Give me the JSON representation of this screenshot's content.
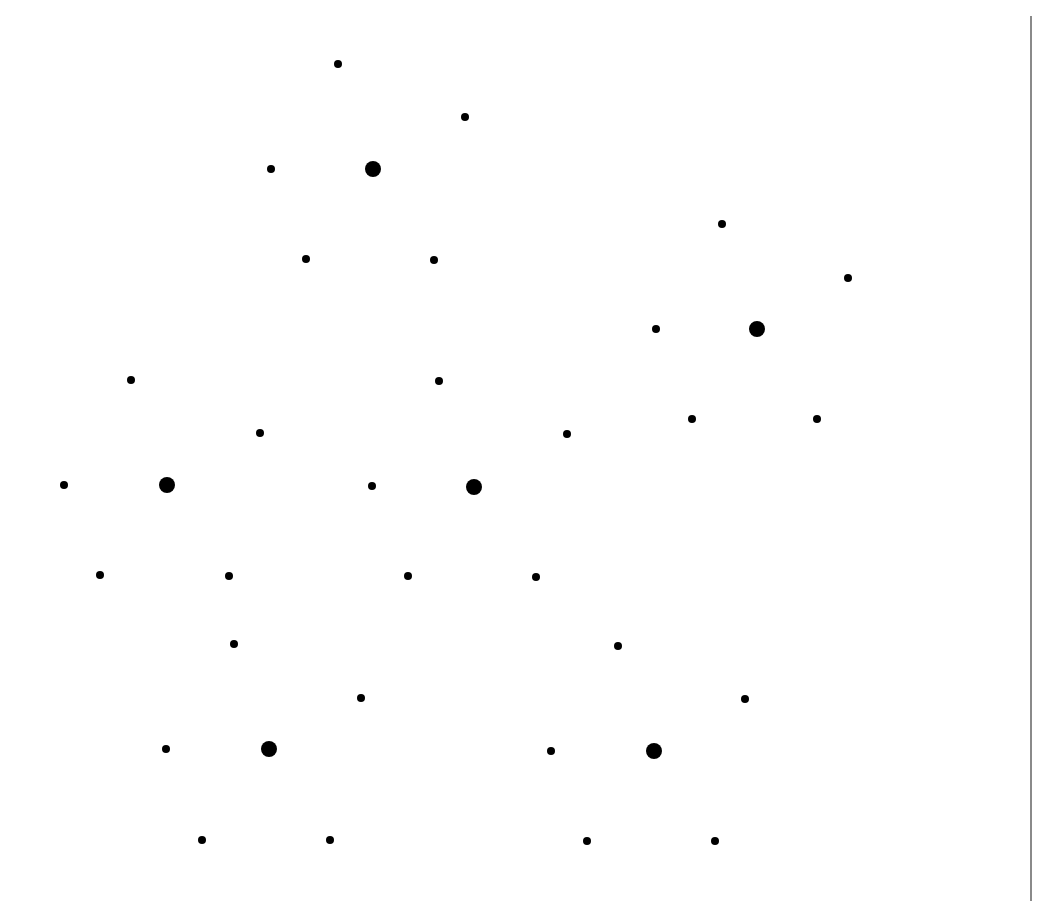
{
  "diagram": {
    "type": "dot-pattern",
    "colors": {
      "background": "#ffffff",
      "dot": "#000000",
      "rule": "#8a8a8a"
    },
    "dot_sizes": {
      "small": 8,
      "large": 16
    },
    "right_rule": {
      "x": 1030,
      "y_start": 16,
      "y_end": 901,
      "width": 2
    },
    "clusters": [
      {
        "id": "top-center",
        "center": {
          "x": 373,
          "y": 169
        },
        "satellites": [
          {
            "x": 338,
            "y": 64
          },
          {
            "x": 465,
            "y": 117
          },
          {
            "x": 271,
            "y": 169
          },
          {
            "x": 306,
            "y": 259
          },
          {
            "x": 434,
            "y": 260
          }
        ]
      },
      {
        "id": "upper-right",
        "center": {
          "x": 757,
          "y": 329
        },
        "satellites": [
          {
            "x": 722,
            "y": 224
          },
          {
            "x": 848,
            "y": 278
          },
          {
            "x": 656,
            "y": 329
          },
          {
            "x": 692,
            "y": 419
          },
          {
            "x": 817,
            "y": 419
          }
        ]
      },
      {
        "id": "middle-left",
        "center": {
          "x": 167,
          "y": 485
        },
        "satellites": [
          {
            "x": 131,
            "y": 380
          },
          {
            "x": 260,
            "y": 433
          },
          {
            "x": 64,
            "y": 485
          },
          {
            "x": 100,
            "y": 575
          },
          {
            "x": 229,
            "y": 576
          }
        ]
      },
      {
        "id": "middle-center",
        "center": {
          "x": 474,
          "y": 487
        },
        "satellites": [
          {
            "x": 439,
            "y": 381
          },
          {
            "x": 567,
            "y": 434
          },
          {
            "x": 372,
            "y": 486
          },
          {
            "x": 408,
            "y": 576
          },
          {
            "x": 536,
            "y": 577
          }
        ]
      },
      {
        "id": "lower-left",
        "center": {
          "x": 269,
          "y": 749
        },
        "satellites": [
          {
            "x": 234,
            "y": 644
          },
          {
            "x": 361,
            "y": 698
          },
          {
            "x": 166,
            "y": 749
          },
          {
            "x": 202,
            "y": 840
          },
          {
            "x": 330,
            "y": 840
          }
        ]
      },
      {
        "id": "lower-right",
        "center": {
          "x": 654,
          "y": 751
        },
        "satellites": [
          {
            "x": 618,
            "y": 646
          },
          {
            "x": 745,
            "y": 699
          },
          {
            "x": 551,
            "y": 751
          },
          {
            "x": 587,
            "y": 841
          },
          {
            "x": 715,
            "y": 841
          }
        ]
      }
    ]
  }
}
